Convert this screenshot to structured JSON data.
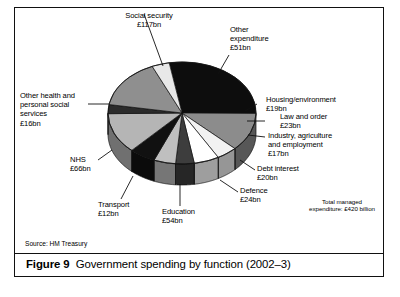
{
  "figure": {
    "number_label": "Figure 9",
    "caption": "Government spending by function (2002–3)",
    "source": "Source: HM Treasury",
    "total_note": "Total managed\nexpenditure: £420 billion"
  },
  "chart_data": {
    "type": "pie",
    "title": "Government spending by function (2002–3)",
    "subtitle": "",
    "xlabel": "",
    "ylabel": "",
    "units": "£ billion",
    "total": 420,
    "three_d": true,
    "legend_position": "none",
    "grid": false,
    "categories": [
      "Social security",
      "Other expenditure",
      "Housing/environment",
      "Law and order",
      "Industry, agriculture and employment",
      "Debt interest",
      "Defence",
      "Education",
      "Transport",
      "NHS",
      "Other health and personal social services"
    ],
    "values": [
      117,
      51,
      19,
      23,
      17,
      20,
      24,
      54,
      12,
      66,
      16
    ],
    "labels": [
      "Social security\n£117bn",
      "Other\nexpenditure\n£51bn",
      "Housing/environment\n£19bn",
      "Law and order\n£23bn",
      "Industry, agriculture\nand employment\n£17bn",
      "Debt interest\n£20bn",
      "Defence\n£24bn",
      "Education\n£54bn",
      "Transport\n£12bn",
      "NHS\n£66bn",
      "Other health and\npersonal social\nservices\n£16bn"
    ],
    "slice_colors": [
      "#0d0d0d",
      "#8c8c8c",
      "#f2f2f2",
      "#ffffff",
      "#3d3d3d",
      "#bfbfbf",
      "#111111",
      "#b5b5b5",
      "#2b2b2b",
      "#8f8f8f",
      "#e8e8e8"
    ]
  },
  "labels": [
    {
      "id": "social-security",
      "text": "Social security\n£117bn"
    },
    {
      "id": "other-expenditure",
      "text": "Other\nexpenditure\n£51bn"
    },
    {
      "id": "housing-environment",
      "text": "Housing/environment\n£19bn"
    },
    {
      "id": "law-and-order",
      "text": "Law and order\n£23bn"
    },
    {
      "id": "industry",
      "text": "Industry, agriculture\nand employment\n£17bn"
    },
    {
      "id": "debt-interest",
      "text": "Debt interest\n£20bn"
    },
    {
      "id": "defence",
      "text": "Defence\n£24bn"
    },
    {
      "id": "education",
      "text": "Education\n£54bn"
    },
    {
      "id": "transport",
      "text": "Transport\n£12bn"
    },
    {
      "id": "nhs",
      "text": "NHS\n£66bn"
    },
    {
      "id": "other-health",
      "text": "Other health and\npersonal social\nservices\n£16bn"
    }
  ]
}
